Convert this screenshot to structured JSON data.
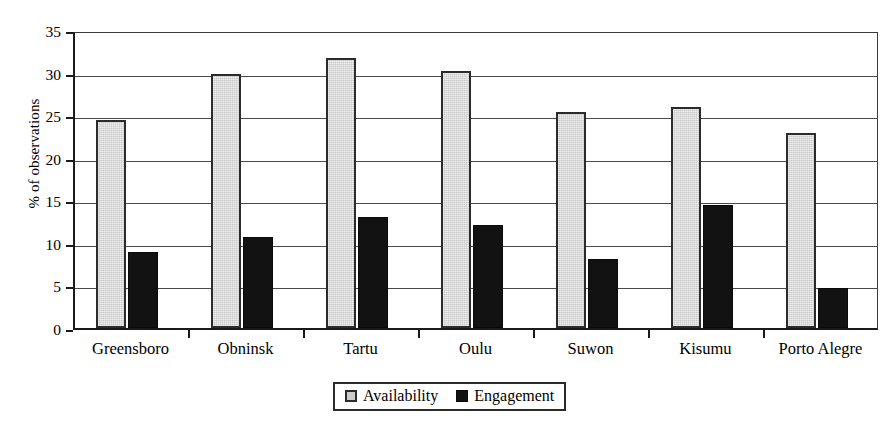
{
  "chart_data": {
    "type": "bar",
    "title": "",
    "subtitle": "",
    "xlabel": "",
    "ylabel": "% of observations",
    "ylim": [
      0,
      35
    ],
    "ytick_step": 5,
    "yticks": [
      "0",
      "5",
      "10",
      "15",
      "20",
      "25",
      "30",
      "35"
    ],
    "grid": true,
    "legend_position": "bottom-center",
    "categories": [
      "Greensboro",
      "Obninsk",
      "Tartu",
      "Oulu",
      "Suwon",
      "Kisumu",
      "Porto Alegre"
    ],
    "series": [
      {
        "name": "Availability",
        "color": "#c9c9c9",
        "values": [
          24.4,
          29.8,
          31.7,
          30.2,
          25.4,
          25.9,
          22.9
        ]
      },
      {
        "name": "Engagement",
        "color": "#121212",
        "values": [
          8.9,
          10.7,
          13.0,
          12.1,
          8.1,
          14.4,
          4.7
        ]
      }
    ]
  },
  "legend": {
    "items": [
      {
        "label": "Availability",
        "swatch": "gray-square-icon"
      },
      {
        "label": "Engagement",
        "swatch": "black-square-icon"
      }
    ]
  }
}
